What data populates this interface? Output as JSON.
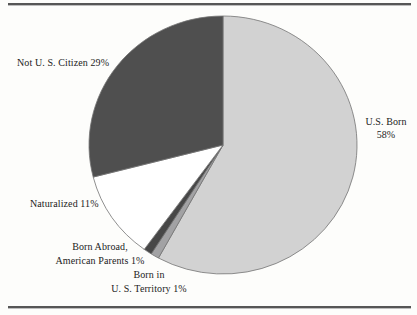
{
  "figure": {
    "background": "#fdfdfb",
    "rule_color": "#565656"
  },
  "chart_data": {
    "type": "pie",
    "title": "",
    "unit": "%",
    "start_angle_deg": 0,
    "direction": "clockwise",
    "center": {
      "x": 223,
      "y": 145
    },
    "radius": {
      "rx": 134,
      "ry": 129
    },
    "outline_color": "#747474",
    "slices": [
      {
        "id": "us-born",
        "label": "U.S. Born",
        "value": 58,
        "color": "#d2d2d2"
      },
      {
        "id": "us-territory",
        "label": "Born in U. S. Territory",
        "value": 1,
        "color": "#a2a2a4"
      },
      {
        "id": "born-abroad",
        "label": "Born Abroad, American Parents",
        "value": 1,
        "color": "#474747"
      },
      {
        "id": "naturalized",
        "label": "Naturalized",
        "value": 11,
        "color": "#ffffff"
      },
      {
        "id": "not-us-citizen",
        "label": "Not U. S. Citizen",
        "value": 29,
        "color": "#4f4f4f"
      }
    ],
    "legend_position": "none",
    "labels_on_chart": true
  },
  "labels": {
    "not_citizen": "Not U. S. Citizen 29%",
    "us_born_line1": "U.S. Born",
    "us_born_line2": "58%",
    "naturalized": "Naturalized 11%",
    "born_abroad_line1": "Born Abroad,",
    "born_abroad_line2": "American Parents 1%",
    "territory_line1": "Born in",
    "territory_line2": "U. S. Territory 1%"
  }
}
